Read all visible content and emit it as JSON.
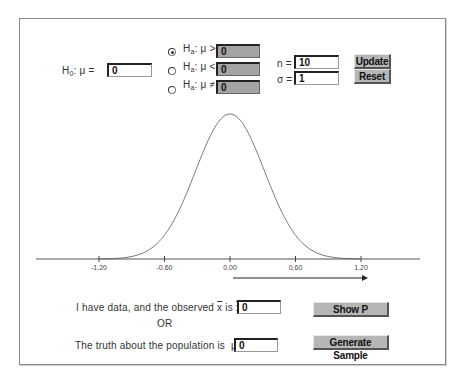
{
  "hypotheses": {
    "h0": {
      "label_main": "H",
      "label_sub": "0",
      "label_rest": ": μ =",
      "value": "0"
    },
    "ha_options": [
      {
        "label_main": "H",
        "label_sub": "a",
        "label_rest": ": μ >",
        "value": "0",
        "selected": true
      },
      {
        "label_main": "H",
        "label_sub": "a",
        "label_rest": ": μ <",
        "value": "0",
        "selected": false
      },
      {
        "label_main": "H",
        "label_sub": "a",
        "label_rest": ": μ ≠",
        "value": "0",
        "selected": false
      }
    ]
  },
  "params": {
    "n_label": "n =",
    "n_value": "10",
    "sigma_label": "σ =",
    "sigma_value": "1"
  },
  "buttons": {
    "update": "Update",
    "reset": "Reset",
    "show_p": "Show P",
    "generate_sample": "Generate Sample"
  },
  "plot": {
    "tick_labels": [
      "-1.20",
      "-0.60",
      "0.00",
      "0.60",
      "1.20"
    ],
    "curve_color": "#7a7a7a",
    "arrow_from": "0.00",
    "arrow_to": "1.20"
  },
  "chart_data": {
    "type": "line",
    "title": "",
    "x_ticks": [
      -1.2,
      -0.6,
      0.0,
      0.6,
      1.2
    ],
    "xlabel": "",
    "ylabel": "",
    "mean": 0.0,
    "sd": 0.316,
    "arrow": {
      "from": 0.0,
      "to": 1.2,
      "direction": "right"
    }
  },
  "data_row": {
    "observed_text_pre": "I have data, and the observed",
    "xbar_symbol": "x",
    "is_text": "is",
    "eq_text": "=",
    "observed_value": "0",
    "or_text": "OR",
    "truth_text": "The truth about the population is",
    "mu_eq": "μ =",
    "truth_value": "0"
  }
}
